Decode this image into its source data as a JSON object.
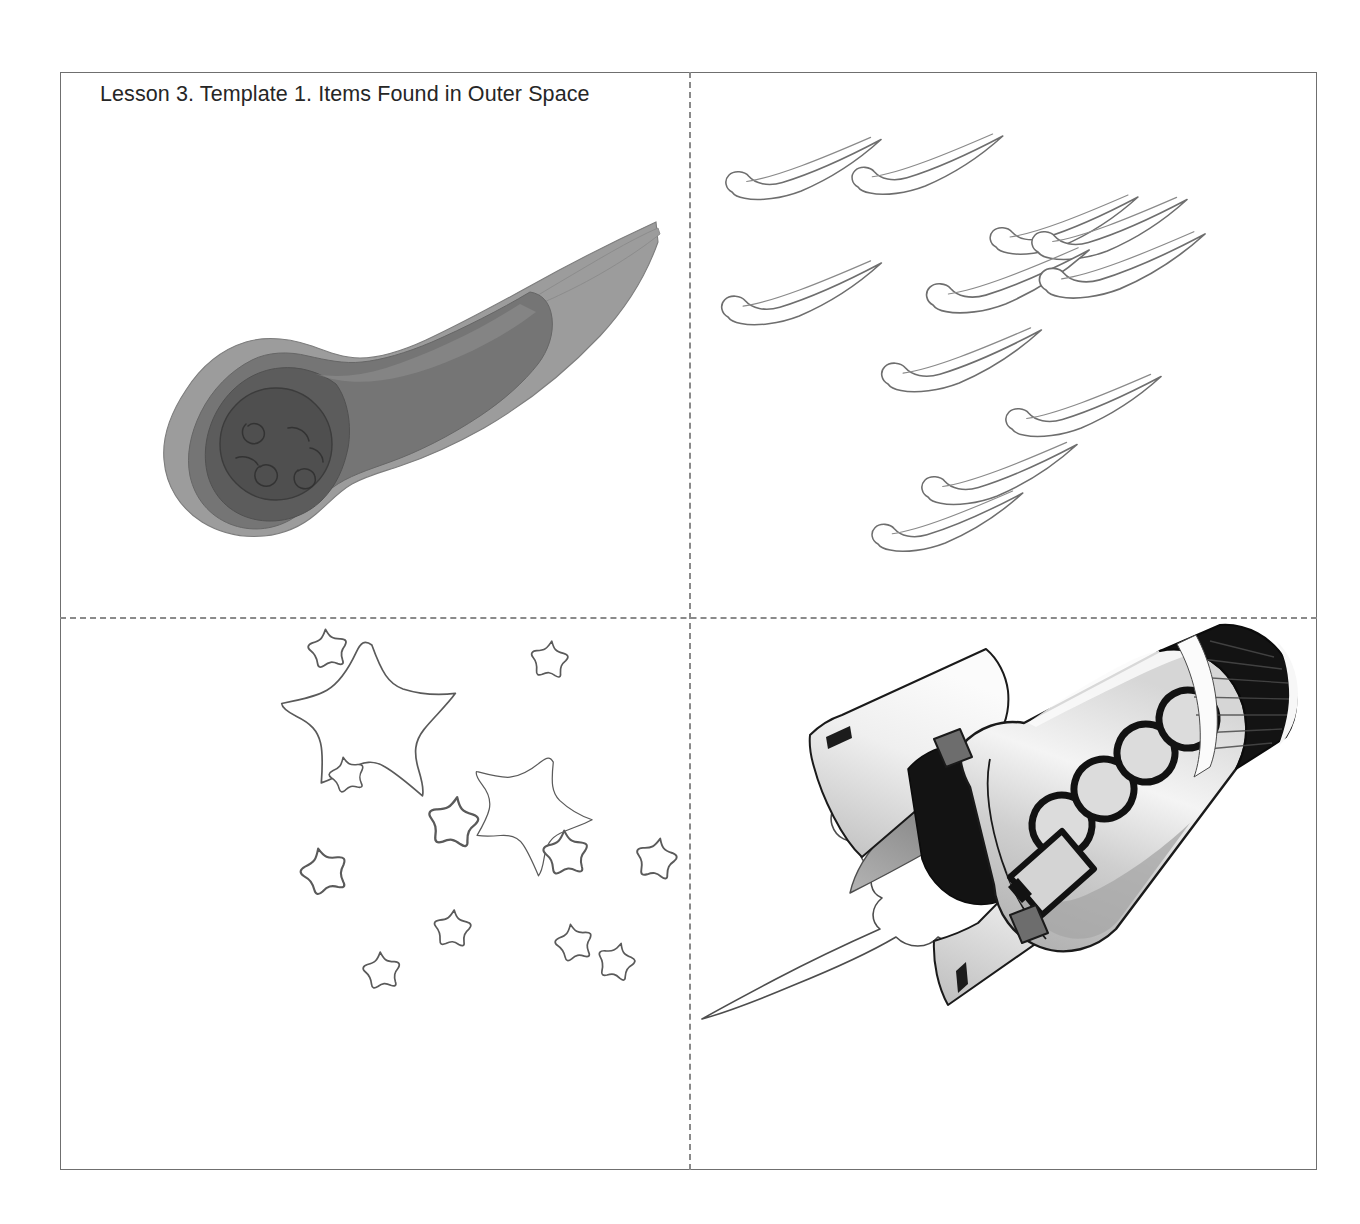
{
  "document": {
    "title": "Lesson 3. Template 1. Items Found in Outer Space",
    "kind": "printable-worksheet",
    "page_background": "#ffffff",
    "border_color": "#6f6f6f",
    "fold_line_color": "#8a8a8a",
    "title_color": "#262626"
  },
  "layout": {
    "quadrant_count": 4,
    "fold_lines": [
      "vertical",
      "horizontal"
    ]
  },
  "quadrants": [
    {
      "id": "comet",
      "position": "top-left",
      "label": "Comet",
      "description": "Large gray comet with rounded cratered head at lower-left and a long tapering tail pointing to the upper right",
      "colors": {
        "tail_light": "#9a9a9a",
        "body_mid": "#7b7b7b",
        "head_dark": "#5e5e5e",
        "core": "#4f4f4f",
        "outline": "#6a6a6a"
      }
    },
    {
      "id": "meteors",
      "position": "top-right",
      "label": "Meteor shower",
      "description": "Eleven thin outlined shooting stars, each a rounded teardrop head with a long narrow tail angled up to the right",
      "count": 11,
      "colors": {
        "outline": "#6e6e6e"
      }
    },
    {
      "id": "stars",
      "position": "bottom-left",
      "label": "Stars",
      "description": "Cluster of outlined five-pointed stars: two large and eleven small",
      "large_count": 2,
      "small_count": 11,
      "colors": {
        "outline": "#5a5a5a"
      }
    },
    {
      "id": "rocket",
      "position": "bottom-right",
      "label": "Rocket ship",
      "description": "Rocket flying toward the upper right with a black nose cone banded by a white stripe, four round windows, a rectangular hatch, two fins and exhaust flame trailing to the lower left",
      "features": {
        "windows": 4,
        "hatch": 1,
        "fins": 2,
        "nozzles": 2,
        "exhaust": "flame-and-smoke"
      },
      "colors": {
        "body_light": "#f2f2f2",
        "body_mid": "#c9c9c9",
        "body_shadow": "#a8a8a8",
        "nose_black": "#141414",
        "stripe_white": "#fbfbfb",
        "nozzle_gray": "#6d6d6d",
        "flame_gray": "#8e8e8e",
        "outline": "#1a1a1a"
      }
    }
  ]
}
